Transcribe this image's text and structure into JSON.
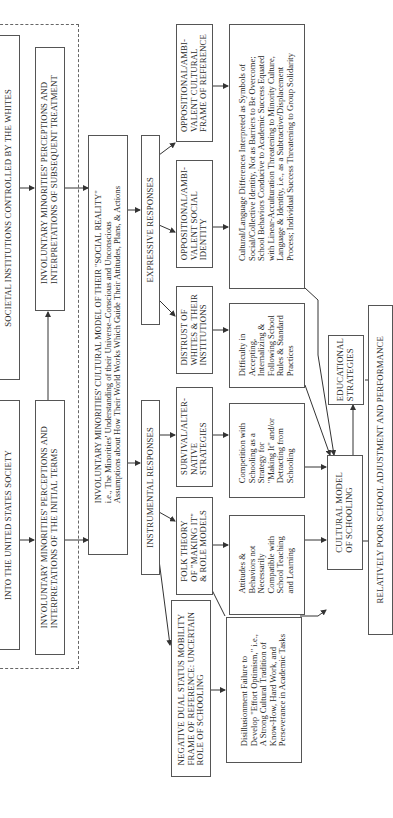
{
  "diagram": {
    "orientation": "rotated 90 degrees counter-clockwise",
    "boxes": {
      "societal_institutions": "SOCIETAL INSTITUTIONS CONTROLLED BY THE WHITES",
      "into_us_society": "INTO THE UNITED STATES SOCIETY",
      "perceptions_subsequent": "INVOLUNTARY MINORITIES' PERCEPTIONS AND\nINTERPRETATIONS OF SUBSEQUENT TREATMENT",
      "perceptions_initial": "INVOLUNTARY MINORITIES' PERCEPTIONS AND\nINTERPRETATIONS OF THE INITIAL TERMS",
      "cultural_model_social_reality": "INVOLUNTARY MINORITIES' CULTURAL MODEL OF THEIR \"SOCIAL REALITY\"\ni.e., The Minorities' Understanding of their Universe–Conscious and Unconscious\nAssumptions about How Their World Works Which Guide Their Attitudes, Plans, & Actions",
      "expressive_responses": "EXPRESSIVE RESPONSES",
      "instrumental_responses": "INSTRUMENTAL RESPONSES",
      "oppositional_frame": "OPPOSITIONAL/AMBI-\nVALENT CULTURAL\nFRAME OF REFERENCE",
      "oppositional_identity": "OPPOSITIONAL/AMBI-\nVALENT SOCIAL\nIDENTITY",
      "distrust": "DISTRUST OF\nWHITES & THEIR\nINSTITUTIONS",
      "survival": "SURVIVAL/ALTER-\nNATIVE\nSTRATEGIES",
      "folk_theory": "FOLK THEORY\nOF \"MAKING IT\"\n& ROLE MODELS",
      "negative_dual": "NEGATIVE DUAL STATUS MOBILITY\nFRAME OF REFERENCE: UNCERTAIN\nROLE OF SCHOOLING",
      "cultural_language_differences": "Cultural/Language Differences Interpreted as Symbols of\nSocial/Collective Identity, Not as Barriers to Be Overcome;\nSchool Behaviors Conducive to Academic Success Equated\nwith Linear-Acculturation Threatening to Minority Culture,\nLanguage & Identity, i.e., as a Subtractive/Displacement\nProcess; Individual Success Threatening to Group Solidarity",
      "difficulty_accepting": "Difficulty in\nAccepting,\nInternalizing &\nFollowing School\nRules & Standard\nPractices",
      "competition": "Competition with\nSchooling as a\nStrategy for\n\"Making It\" and/or\nDetracting from\nSchooling",
      "attitudes_behaviors": "Attitudes &\nBehaviors not\nNecessarily\nCompatible with\nSchool Teaching\nand Learning",
      "disillusionment": "Disillusionment Failure to\nDevelop \"Effort Optimism,\" i.e.,\nA Strong Cultural Tradition of\nKnow-How, Hard Work, and\nPerseverance in Academic Tasks",
      "cultural_model_schooling": "CULTURAL MODEL\nOF SCHOOLING",
      "educational_strategies": "EDUCATIONAL\nSTRATEGIES",
      "relatively_poor": "RELATIVELY POOR SCHOOL ADJUSTMENT AND PERFORMANCE"
    }
  }
}
